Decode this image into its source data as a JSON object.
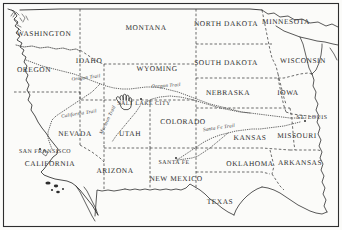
{
  "map": {
    "title": "Western United States with Pioneer Trails",
    "background_color": "#fbfbf9",
    "ink_color": "#2e2e2e",
    "border_style": "dashed",
    "states": [
      {
        "name": "WASHINGTON",
        "x": 44,
        "y": 33
      },
      {
        "name": "OREGON",
        "x": 34,
        "y": 69
      },
      {
        "name": "IDAHO",
        "x": 89,
        "y": 60
      },
      {
        "name": "MONTANA",
        "x": 146,
        "y": 27
      },
      {
        "name": "NORTH DAKOTA",
        "x": 226,
        "y": 23
      },
      {
        "name": "MINNESOTA",
        "x": 286,
        "y": 21
      },
      {
        "name": "WYOMING",
        "x": 157,
        "y": 68
      },
      {
        "name": "SOUTH DAKOTA",
        "x": 226,
        "y": 62
      },
      {
        "name": "WISCONSIN",
        "x": 303,
        "y": 60
      },
      {
        "name": "NEBRASKA",
        "x": 228,
        "y": 92
      },
      {
        "name": "IOWA",
        "x": 288,
        "y": 92
      },
      {
        "name": "NEVADA",
        "x": 75,
        "y": 133
      },
      {
        "name": "UTAH",
        "x": 130,
        "y": 133
      },
      {
        "name": "COLORADO",
        "x": 183,
        "y": 121
      },
      {
        "name": "KANSAS",
        "x": 250,
        "y": 137
      },
      {
        "name": "MISSOURI",
        "x": 297,
        "y": 135
      },
      {
        "name": "CALIFORNIA",
        "x": 50,
        "y": 163
      },
      {
        "name": "ARIZONA",
        "x": 115,
        "y": 170
      },
      {
        "name": "NEW MEXICO",
        "x": 176,
        "y": 178
      },
      {
        "name": "OKLAHOMA",
        "x": 250,
        "y": 163
      },
      {
        "name": "ARKANSAS",
        "x": 300,
        "y": 162
      },
      {
        "name": "TEXAS",
        "x": 220,
        "y": 201
      }
    ],
    "cities": [
      {
        "name": "SALT LAKE CITY",
        "x": 144,
        "y": 104
      },
      {
        "name": "SAN FRANSISCO",
        "x": 45,
        "y": 152
      },
      {
        "name": "SANTA FE",
        "x": 174,
        "y": 163
      },
      {
        "name": "ST. LOUIS",
        "x": 312,
        "y": 118
      }
    ],
    "trails": [
      {
        "name": "Oregon Trail",
        "x": 86,
        "y": 78,
        "rotation": -7
      },
      {
        "name": "Oregon Trail",
        "x": 166,
        "y": 86,
        "rotation": -4
      },
      {
        "name": "California Trail",
        "x": 79,
        "y": 114,
        "rotation": -9
      },
      {
        "name": "Mormon Trail",
        "x": 108,
        "y": 120,
        "rotation": -64
      },
      {
        "name": "Santa Fe Trail",
        "x": 219,
        "y": 128,
        "rotation": -8
      }
    ],
    "markers": [
      {
        "name": "pointing-hand-cursor",
        "x": 122,
        "y": 99
      }
    ]
  }
}
